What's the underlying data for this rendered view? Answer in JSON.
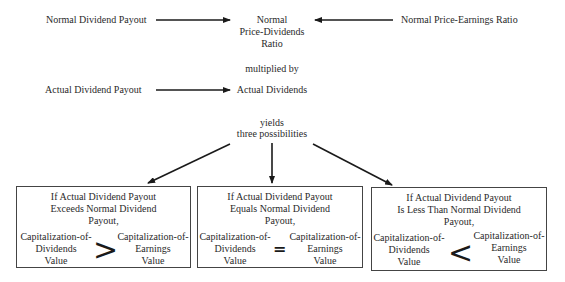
{
  "diagram": {
    "inputs": {
      "normal_payout": "Normal Dividend Payout",
      "normal_pe": "Normal Price-Earnings Ratio",
      "actual_payout": "Actual Dividend Payout"
    },
    "center": {
      "normal_pd_line1": "Normal",
      "normal_pd_line2": "Price-Dividends",
      "normal_pd_line3": "Ratio",
      "multiplied_by": "multiplied by",
      "actual_dividends": "Actual Dividends",
      "yields_line1": "yields",
      "yields_line2": "three possibilities"
    },
    "outcomes": [
      {
        "head_line1": "If Actual Dividend Payout",
        "head_line2": "Exceeds Normal Dividend",
        "head_line3": "Payout,",
        "lhs_line1": "Capitalization-of-",
        "lhs_line2": "Dividends",
        "lhs_line3": "Value",
        "operator": ">",
        "rhs_line1": "Capitalization-of-",
        "rhs_line2": "Earnings",
        "rhs_line3": "Value"
      },
      {
        "head_line1": "If Actual Dividend Payout",
        "head_line2": "Equals Normal Dividend",
        "head_line3": "Payout,",
        "lhs_line1": "Capitalization-of-",
        "lhs_line2": "Dividends",
        "lhs_line3": "Value",
        "operator": "=",
        "rhs_line1": "Capitalization-of-",
        "rhs_line2": "Earnings",
        "rhs_line3": "Value"
      },
      {
        "head_line1": "If Actual Dividend Payout",
        "head_line2": "Is Less Than Normal Dividend",
        "head_line3": "Payout,",
        "lhs_line1": "Capitalization-of-",
        "lhs_line2": "Dividends",
        "lhs_line3": "Value",
        "operator": "<",
        "rhs_line1": "Capitalization-of-",
        "rhs_line2": "Earnings",
        "rhs_line3": "Value"
      }
    ]
  }
}
